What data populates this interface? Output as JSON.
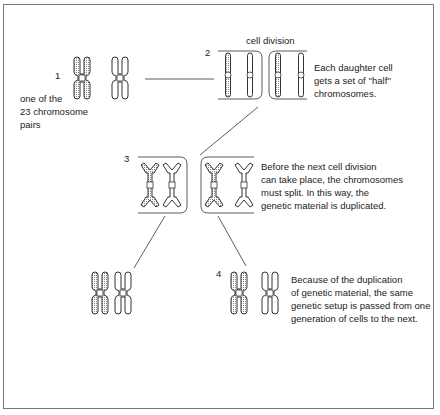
{
  "figure": {
    "title": "cell division",
    "steps": [
      {
        "number": "1",
        "caption_lines": [
          "one of the",
          "23 chromosome",
          "pairs"
        ]
      },
      {
        "number": "2",
        "caption_lines": [
          "Each daughter cell",
          "gets a set of ''half''",
          "chromosomes."
        ]
      },
      {
        "number": "3",
        "caption_lines": [
          "Before the next cell division",
          "can take place, the chromosomes",
          "must split. In this way, the",
          "genetic material is duplicated."
        ]
      },
      {
        "number": "4",
        "caption_lines": [
          "Because of the duplication",
          "of genetic material, the same",
          "genetic setup is passed from one",
          "generation of cells to the next."
        ]
      }
    ],
    "colors": {
      "ink": "#333333",
      "shaded": "#bdbdbd",
      "frame": "#777777",
      "background": "#ffffff"
    }
  }
}
